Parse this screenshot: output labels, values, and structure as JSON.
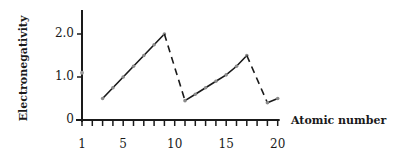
{
  "chart_data": {
    "type": "line",
    "title": "",
    "xlabel": "Atomic number",
    "ylabel": "Electronegativity",
    "x": [
      1,
      3,
      4,
      5,
      6,
      7,
      8,
      9,
      11,
      12,
      13,
      14,
      15,
      16,
      17,
      19,
      20
    ],
    "series": [
      {
        "name": "H",
        "points": [
          [
            1,
            1.1
          ]
        ],
        "style": "point"
      },
      {
        "name": "Period 2 (Li–F)",
        "points": [
          [
            3,
            0.5
          ],
          [
            4,
            0.75
          ],
          [
            5,
            1.0
          ],
          [
            6,
            1.25
          ],
          [
            7,
            1.5
          ],
          [
            8,
            1.75
          ],
          [
            9,
            2.0
          ]
        ],
        "style": "solid"
      },
      {
        "name": "F→Na drop",
        "points": [
          [
            9,
            2.0
          ],
          [
            11,
            0.45
          ]
        ],
        "style": "dashed"
      },
      {
        "name": "Period 3 (Na–Cl)",
        "points": [
          [
            11,
            0.45
          ],
          [
            12,
            0.6
          ],
          [
            13,
            0.75
          ],
          [
            14,
            0.9
          ],
          [
            15,
            1.05
          ],
          [
            16,
            1.25
          ],
          [
            17,
            1.5
          ]
        ],
        "style": "solid"
      },
      {
        "name": "Cl→K drop",
        "points": [
          [
            17,
            1.5
          ],
          [
            19,
            0.4
          ]
        ],
        "style": "dashed"
      },
      {
        "name": "K–Ca",
        "points": [
          [
            19,
            0.4
          ],
          [
            20,
            0.5
          ]
        ],
        "style": "solid"
      }
    ],
    "x_tick_labels": [
      "1",
      "5",
      "10",
      "15",
      "20"
    ],
    "y_tick_labels": [
      "0",
      "1.0",
      "2.0"
    ],
    "xlim": [
      1,
      20
    ],
    "ylim": [
      0,
      2.6
    ],
    "grid": false,
    "legend": "none"
  },
  "labels": {
    "ylabel": "Electronegativity",
    "xlabel": "Atomic number",
    "yticks": [
      {
        "label": "0",
        "value": 0
      },
      {
        "label": "1.0",
        "value": 1.0
      },
      {
        "label": "2.0",
        "value": 2.0
      }
    ],
    "xticks": [
      {
        "label": "1",
        "value": 1
      },
      {
        "label": "5",
        "value": 5
      },
      {
        "label": "10",
        "value": 10
      },
      {
        "label": "15",
        "value": 15
      },
      {
        "label": "20",
        "value": 20
      }
    ]
  }
}
